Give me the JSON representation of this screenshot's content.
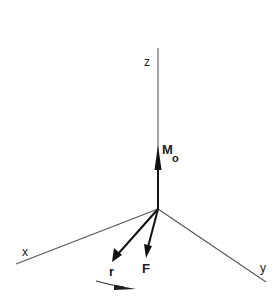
{
  "diagram": {
    "title": "",
    "type": "3D moment vector diagram",
    "axes": [
      {
        "name": "x",
        "label": "x"
      },
      {
        "name": "y",
        "label": "y"
      },
      {
        "name": "z",
        "label": "z"
      }
    ],
    "vectors": [
      {
        "name": "moment",
        "label": "M",
        "subscript": "o"
      },
      {
        "name": "position",
        "label": "r"
      },
      {
        "name": "force",
        "label": "F"
      }
    ],
    "rotation_indicator": "curved arrow showing rotation direction",
    "colors": {
      "axis": "#555555",
      "vector": "#111111",
      "background": "#ffffff"
    }
  }
}
